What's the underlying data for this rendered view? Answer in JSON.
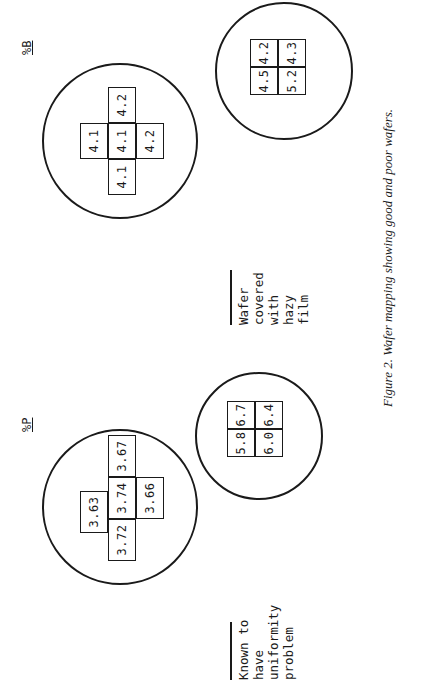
{
  "figure": {
    "caption": "Figure 2. Wafer mapping showing good and poor wafers.",
    "columns": [
      {
        "label": "%P"
      },
      {
        "label": "%B"
      }
    ],
    "wafers": {
      "p_top": {
        "cells": [
          "3.63",
          "3.72",
          "3.74",
          "3.67",
          "3.66"
        ]
      },
      "b_top": {
        "cells": [
          "4.1",
          "4.1",
          "4.1",
          "4.2",
          "4.2"
        ]
      },
      "p_bottom": {
        "cells": [
          "5.8",
          "6.7",
          "6.4",
          "6.0"
        ]
      },
      "b_bottom": {
        "cells": [
          "4.5",
          "4.2",
          "5.2",
          "4.3"
        ]
      }
    },
    "notes": {
      "uniformity": "Known to\nhave\nuniformity\nproblem",
      "hazy": "Wafer\ncovered\nwith\nhazy\nfilm"
    }
  }
}
